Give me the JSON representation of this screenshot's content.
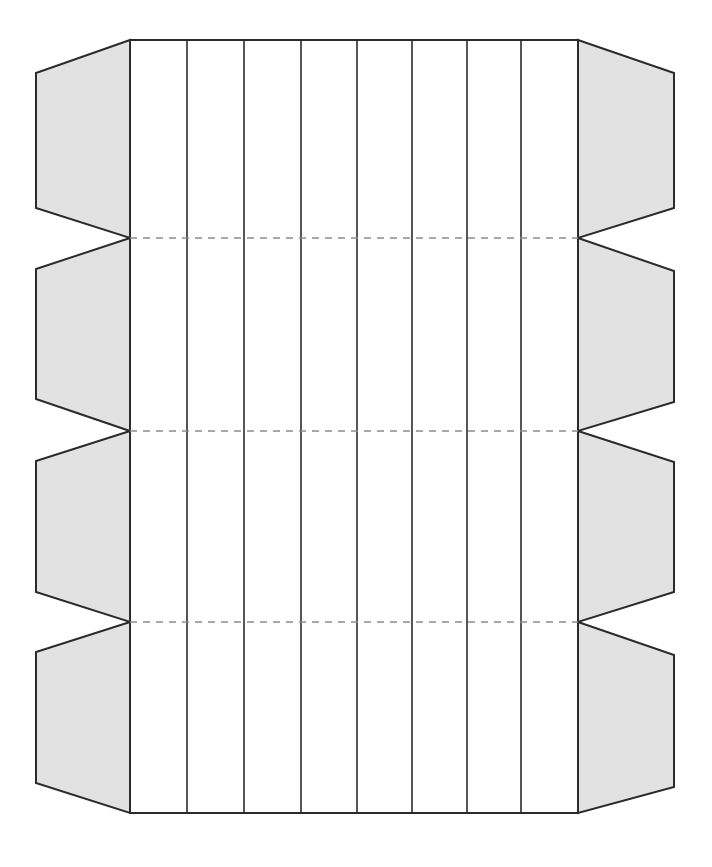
{
  "document": {
    "title": "Box Dieline Template",
    "type": "packaging-dieline",
    "canvas": {
      "width": 712,
      "height": 867,
      "background": "#ffffff"
    }
  },
  "style": {
    "cut_line_color": "#2b2b2b",
    "cut_line_width": 2,
    "panel_divider_color": "#2b2b2b",
    "panel_divider_width": 1.6,
    "fold_line_color": "#8c8c8c",
    "fold_line_width": 1.6,
    "fold_line_dash": "7 6",
    "flap_fill": "#e2e2e2",
    "panel_fill": "#ffffff"
  },
  "geometry": {
    "body_left_x": 130,
    "body_right_x": 578,
    "body_top_y": 40,
    "body_bottom_y": 813,
    "left_flap_outer_x": 36,
    "right_flap_outer_x": 674,
    "flap_corner_inset": 32,
    "panel_divider_x": [
      187,
      244,
      301,
      357,
      412,
      467,
      521
    ],
    "fold_rows_y": [
      238,
      431,
      622
    ],
    "row_boundaries_y": [
      40,
      238,
      431,
      622,
      813
    ]
  },
  "body": {
    "name": "main-body",
    "panel_count": 8,
    "row_count": 4,
    "panels": [
      {
        "index": 1,
        "x0": 130,
        "x1": 187
      },
      {
        "index": 2,
        "x0": 187,
        "x1": 244
      },
      {
        "index": 3,
        "x0": 244,
        "x1": 301
      },
      {
        "index": 4,
        "x0": 301,
        "x1": 357
      },
      {
        "index": 5,
        "x0": 357,
        "x1": 412
      },
      {
        "index": 6,
        "x0": 412,
        "x1": 467
      },
      {
        "index": 7,
        "x0": 467,
        "x1": 521
      },
      {
        "index": 8,
        "x0": 521,
        "x1": 578
      }
    ]
  },
  "fold_lines": [
    {
      "name": "fold-line-1",
      "y": 238,
      "x0": 130,
      "x1": 578,
      "style": "dashed"
    },
    {
      "name": "fold-line-2",
      "y": 431,
      "x0": 130,
      "x1": 578,
      "style": "dashed"
    },
    {
      "name": "fold-line-3",
      "y": 622,
      "x0": 130,
      "x1": 578,
      "style": "dashed"
    }
  ],
  "flaps": {
    "left": [
      {
        "name": "left-flap-1",
        "points": "130,40 36,73 36,208 130,238",
        "row": 1
      },
      {
        "name": "left-flap-2",
        "points": "130,238 36,269 36,399 130,431",
        "row": 2
      },
      {
        "name": "left-flap-3",
        "points": "130,431 36,461 36,592 130,622",
        "row": 3
      },
      {
        "name": "left-flap-4",
        "points": "130,622 36,652 36,783 130,813",
        "row": 4
      }
    ],
    "right": [
      {
        "name": "right-flap-1",
        "points": "578,40 674,73 674,208 578,238",
        "row": 1
      },
      {
        "name": "right-flap-2",
        "points": "578,238 674,271 674,402 578,431",
        "row": 2
      },
      {
        "name": "right-flap-3",
        "points": "578,431 674,462 674,592 578,622",
        "row": 3
      },
      {
        "name": "right-flap-4",
        "points": "578,622 674,655 674,787 578,813",
        "row": 4
      }
    ]
  }
}
